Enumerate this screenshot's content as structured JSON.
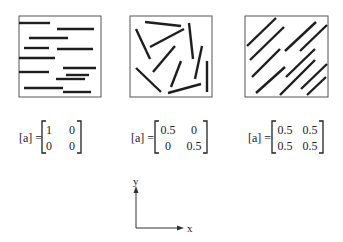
{
  "panels": [
    {
      "name": "aligned-x",
      "box": {
        "x": 19,
        "y": 16,
        "w": 82,
        "h": 81
      },
      "label_prefix": "[a] =",
      "matrix": [
        [
          "1",
          "0"
        ],
        [
          "0",
          "0"
        ]
      ],
      "fibers": [
        [
          19,
          23,
          50,
          23
        ],
        [
          57,
          29,
          94,
          29
        ],
        [
          29,
          38,
          68,
          38
        ],
        [
          24,
          48,
          49,
          48
        ],
        [
          57,
          49,
          93,
          49
        ],
        [
          19,
          58,
          55,
          58
        ],
        [
          63,
          68,
          96,
          68
        ],
        [
          19,
          72,
          49,
          72
        ],
        [
          66,
          75,
          89,
          75
        ],
        [
          56,
          79,
          85,
          79
        ],
        [
          24,
          88,
          63,
          88
        ],
        [
          63,
          92,
          91,
          92
        ]
      ]
    },
    {
      "name": "random",
      "box": {
        "x": 130,
        "y": 16,
        "w": 82,
        "h": 81
      },
      "label_prefix": "[a] =",
      "matrix": [
        [
          "0.5",
          "0"
        ],
        [
          "0",
          "0.5"
        ]
      ],
      "fibers": [
        [
          145,
          22,
          181,
          26
        ],
        [
          136,
          29,
          150,
          59
        ],
        [
          150,
          47,
          184,
          29
        ],
        [
          189,
          23,
          193,
          59
        ],
        [
          175,
          46,
          153,
          72
        ],
        [
          202,
          46,
          195,
          79
        ],
        [
          181,
          61,
          171,
          87
        ],
        [
          207,
          61,
          207,
          92
        ],
        [
          136,
          68,
          161,
          92
        ],
        [
          168,
          93,
          201,
          84
        ]
      ]
    },
    {
      "name": "aligned-diagonal",
      "box": {
        "x": 245,
        "y": 16,
        "w": 83,
        "h": 81
      },
      "label_prefix": "[a] =",
      "matrix": [
        [
          "0.5",
          "0.5"
        ],
        [
          "0.5",
          "0.5"
        ]
      ],
      "fibers": [
        [
          247,
          46,
          276,
          18
        ],
        [
          250,
          60,
          284,
          27
        ],
        [
          285,
          51,
          316,
          22
        ],
        [
          300,
          51,
          327,
          25
        ],
        [
          252,
          77,
          280,
          49
        ],
        [
          286,
          77,
          315,
          49
        ],
        [
          256,
          93,
          285,
          67
        ],
        [
          280,
          95,
          315,
          60
        ],
        [
          301,
          89,
          327,
          64
        ],
        [
          307,
          95,
          326,
          77
        ]
      ]
    }
  ],
  "axes": {
    "x_label": "x",
    "y_label": "y",
    "origin": {
      "x": 136,
      "y": 228
    },
    "x_end": 182,
    "y_end": 188
  },
  "colors": {
    "fiber": "#1e1e1e",
    "box": "#555555",
    "text": "#222222"
  }
}
